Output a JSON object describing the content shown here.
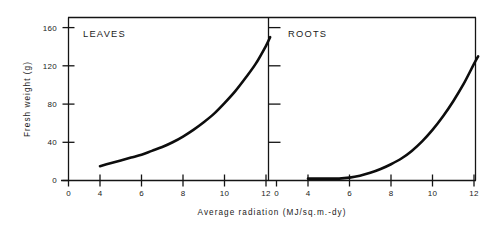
{
  "chart_data": {
    "type": "line",
    "title": "",
    "xlabel": "Average radiation (MJ/sq.m.-dy)",
    "ylabel": "Fresh weight (g)",
    "xlim": [
      0,
      12.8
    ],
    "ylim": [
      0,
      170
    ],
    "grid": false,
    "legend_position": "none",
    "x_ticks": [
      0,
      4,
      6,
      8,
      10,
      12
    ],
    "x_tick_labels": [
      "0",
      "4",
      "6",
      "8",
      "10",
      "12"
    ],
    "y_ticks": [
      0,
      40,
      80,
      120,
      160
    ],
    "y_tick_labels": [
      "0",
      "40",
      "80",
      "120",
      "160"
    ],
    "panels": [
      {
        "name": "leaves",
        "label": "LEAVES",
        "y_axis_labeled": true,
        "series": [
          {
            "name": "LEAVES",
            "x": [
              4.0,
              4.5,
              5.0,
              5.5,
              6.0,
              6.5,
              7.0,
              7.5,
              8.0,
              8.5,
              9.0,
              9.5,
              10.0,
              10.5,
              11.0,
              11.5,
              12.0,
              12.2
            ],
            "values": [
              15,
              18,
              21,
              24,
              27,
              31,
              35,
              40,
              46,
              53,
              61,
              70,
              81,
              93,
              107,
              122,
              141,
              150
            ]
          }
        ]
      },
      {
        "name": "roots",
        "label": "ROOTS",
        "y_axis_labeled": false,
        "series": [
          {
            "name": "ROOTS",
            "x": [
              4.0,
              4.5,
              5.0,
              5.5,
              6.0,
              6.5,
              7.0,
              7.5,
              8.0,
              8.5,
              9.0,
              9.5,
              10.0,
              10.5,
              11.0,
              11.5,
              12.0,
              12.2
            ],
            "values": [
              2,
              2,
              2,
              2,
              3,
              5,
              8,
              12,
              17,
              23,
              31,
              41,
              53,
              67,
              83,
              101,
              122,
              130
            ]
          }
        ]
      }
    ]
  },
  "axis": {
    "y_title": "Fresh weight (g)",
    "x_title": "Average radiation (MJ/sq.m.-dy)"
  },
  "panel_labels": {
    "left": "LEAVES",
    "right": "ROOTS"
  },
  "y_tick_labels": {
    "t0": "0",
    "t1": "40",
    "t2": "80",
    "t3": "120",
    "t4": "160"
  },
  "x_tick_labels_left": {
    "t0": "0",
    "t1": "4",
    "t2": "6",
    "t3": "8",
    "t4": "10",
    "t5": "12"
  },
  "x_tick_labels_right": {
    "t0": "0",
    "t1": "4",
    "t2": "6",
    "t3": "8",
    "t4": "10",
    "t5": "12"
  },
  "colors": {
    "curve": "#0d0d0d",
    "axis": "#141414",
    "background": "#ffffff"
  }
}
